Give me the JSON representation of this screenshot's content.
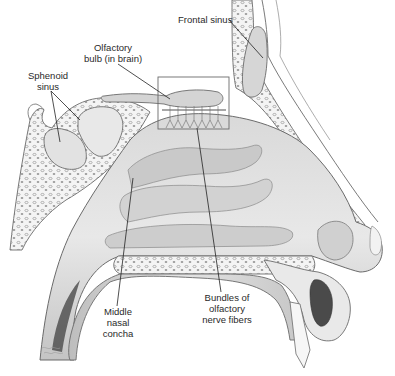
{
  "figure": {
    "colors": {
      "background": "#ffffff",
      "outline": "#6b6b6b",
      "tissue_light": "#e6e6e6",
      "tissue_mid": "#cfcfcf",
      "tissue_dark": "#a9a9a9",
      "cavity_dark": "#4a4a4a",
      "leader_line": "#222222",
      "label_text": "#2a2a2a"
    },
    "labels": {
      "frontal_sinus": "Frontal sinus",
      "olfactory_bulb_line1": "Olfactory",
      "olfactory_bulb_line2": "bulb (in brain)",
      "sphenoid_line1": "Sphenoid",
      "sphenoid_line2": "sinus",
      "middle_concha_line1": "Middle",
      "middle_concha_line2": "nasal",
      "middle_concha_line3": "concha",
      "bundles_line1": "Bundles of",
      "bundles_line2": "olfactory",
      "bundles_line3": "nerve fibers"
    },
    "callouts": [
      {
        "id": "frontal-sinus",
        "text_anchor": [
          229,
          20
        ],
        "target": [
          263,
          58
        ]
      },
      {
        "id": "olfactory-bulb",
        "text_anchor": [
          118,
          64
        ],
        "target": [
          170,
          99
        ]
      },
      {
        "id": "sphenoid-sinus-a",
        "text_anchor": [
          51,
          91
        ],
        "target": [
          60,
          142
        ]
      },
      {
        "id": "sphenoid-sinus-b",
        "text_anchor": [
          51,
          91
        ],
        "target": [
          80,
          120
        ]
      },
      {
        "id": "middle-concha",
        "text_anchor": [
          117,
          306
        ],
        "target": [
          133,
          178
        ]
      },
      {
        "id": "bundles",
        "text_anchor": [
          221,
          292
        ],
        "target": [
          197,
          128
        ]
      }
    ],
    "inset_box": {
      "x": 158,
      "y": 77,
      "width": 71,
      "height": 52
    }
  }
}
